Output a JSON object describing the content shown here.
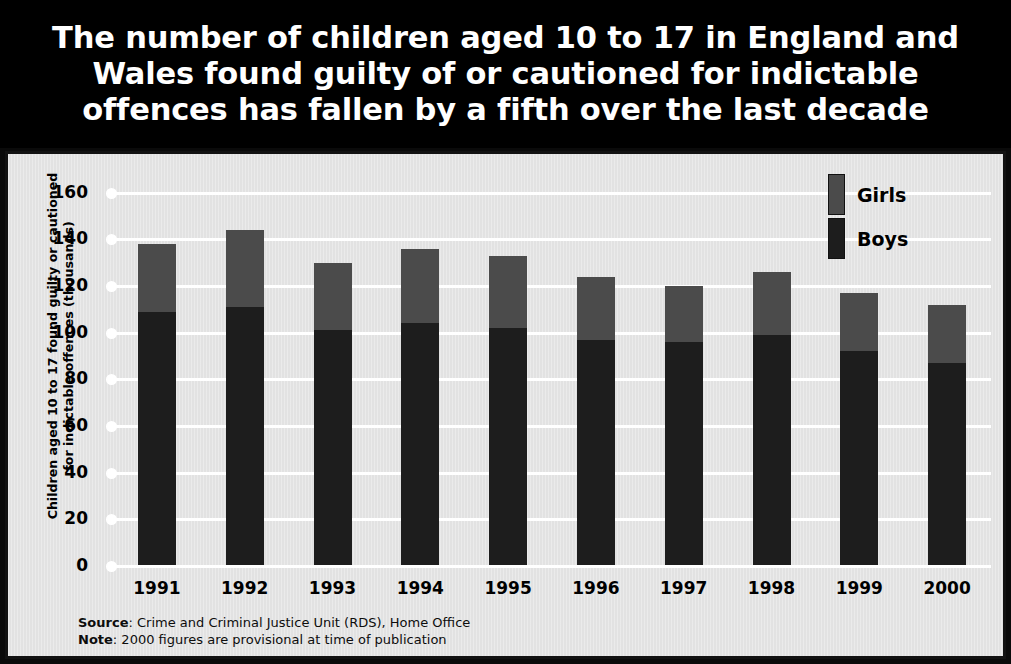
{
  "title": "The number of children aged 10 to 17 in England and Wales found guilty of or cautioned for indictable offences has fallen by a fifth over the last decade",
  "footnote": {
    "source_label": "Source",
    "source_text": ": Crime and Criminal Justice Unit (RDS), Home Office",
    "note_label": "Note",
    "note_text": ": 2000 figures are provisional at time of publication"
  },
  "colors": {
    "girls": "#4b4b4b",
    "boys": "#1d1d1d",
    "banner": "#000000",
    "panel": "#e2e2e2",
    "gridline": "#ffffff"
  },
  "chart_data": {
    "type": "bar",
    "stacked": true,
    "title": "The number of children aged 10 to 17 in England and Wales found guilty of or cautioned for indictable offences has fallen by a fifth over the last decade",
    "xlabel": "",
    "ylabel": "Children aged 10 to 17 found guilty or cautioned for indictable offences (thousands)",
    "ylabel_line1": "Children aged 10 to 17 found guilty or cautioned",
    "ylabel_line2": "for indictable offences (thousands)",
    "categories": [
      "1991",
      "1992",
      "1993",
      "1994",
      "1995",
      "1996",
      "1997",
      "1998",
      "1999",
      "2000"
    ],
    "series": [
      {
        "name": "Boys",
        "values": [
          109,
          111,
          101,
          104,
          102,
          97,
          96,
          99,
          92,
          87
        ]
      },
      {
        "name": "Girls",
        "values": [
          29,
          33,
          29,
          32,
          31,
          27,
          24,
          27,
          25,
          25
        ]
      }
    ],
    "totals": [
      138,
      144,
      130,
      136,
      133,
      124,
      120,
      126,
      117,
      112
    ],
    "yticks": [
      0,
      20,
      40,
      60,
      80,
      100,
      120,
      140,
      160
    ],
    "ylim": [
      0,
      165
    ],
    "ytick_labels": [
      "0",
      "20",
      "40",
      "60",
      "80",
      "100",
      "120",
      "140",
      "160"
    ],
    "grid": true,
    "legend_position": "top-right",
    "legend": [
      "Girls",
      "Boys"
    ]
  }
}
